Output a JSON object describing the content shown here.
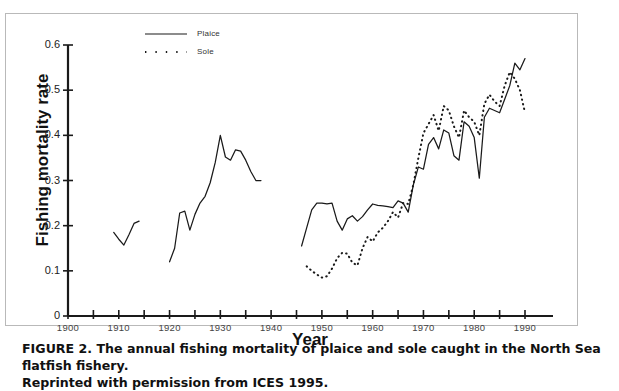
{
  "figure": {
    "caption_line1": "FIGURE 2. The annual fishing mortality of plaice and sole caught in the North Sea flatfish fishery.",
    "caption_line2": "Reprinted with permission from ICES 1995."
  },
  "legend": {
    "entries": [
      {
        "label": "Plaice",
        "style": "solid"
      },
      {
        "label": "Sole",
        "style": "dotted"
      }
    ]
  },
  "axes": {
    "y_title": "Fishing mortality rate",
    "x_title": "Year",
    "y_ticks": [
      "0",
      "0.1",
      "0.2",
      "0.3",
      "0.4",
      "0.5",
      "0.6"
    ],
    "x_ticks": [
      "1900",
      "1910",
      "1920",
      "1930",
      "1940",
      "1950",
      "1960",
      "1970",
      "1980",
      "1990"
    ]
  },
  "chart_data": {
    "type": "line",
    "title": "The annual fishing mortality of plaice and sole caught in the North Sea flatfish fishery",
    "xlabel": "Year",
    "ylabel": "Fishing mortality rate",
    "xlim": [
      1900,
      1990
    ],
    "ylim": [
      0,
      0.6
    ],
    "yticks": [
      0,
      0.1,
      0.2,
      0.3,
      0.4,
      0.5,
      0.6
    ],
    "xticks": [
      1900,
      1910,
      1920,
      1930,
      1940,
      1950,
      1960,
      1970,
      1980,
      1990
    ],
    "x_minor_tick_step": 5,
    "grid": false,
    "legend_position": "top-center",
    "colors": {
      "plaice": "#1a1a1a",
      "sole": "#1a1a1a"
    },
    "series": [
      {
        "name": "Plaice",
        "style": "solid",
        "segments": [
          {
            "x": [
              1909,
              1910,
              1911,
              1912,
              1913,
              1914
            ],
            "y": [
              0.185,
              0.17,
              0.157,
              0.18,
              0.205,
              0.21
            ]
          },
          {
            "x": [
              1920,
              1921,
              1922,
              1923,
              1924,
              1925,
              1926,
              1927,
              1928,
              1929,
              1930,
              1931,
              1932,
              1933,
              1934,
              1935,
              1936,
              1937,
              1938
            ],
            "y": [
              0.12,
              0.15,
              0.228,
              0.232,
              0.19,
              0.225,
              0.25,
              0.265,
              0.295,
              0.34,
              0.4,
              0.352,
              0.345,
              0.368,
              0.365,
              0.345,
              0.32,
              0.3,
              0.3
            ]
          },
          {
            "x": [
              1946,
              1947,
              1948,
              1949,
              1950,
              1951,
              1952,
              1953,
              1954,
              1955,
              1956,
              1957,
              1958,
              1959,
              1960,
              1961,
              1962,
              1963,
              1964,
              1965,
              1966,
              1967,
              1968,
              1969,
              1970,
              1971,
              1972,
              1973,
              1974,
              1975,
              1976,
              1977,
              1978,
              1979,
              1980,
              1981,
              1982,
              1983,
              1984,
              1985,
              1986,
              1987,
              1988,
              1989,
              1990
            ],
            "y": [
              0.155,
              0.195,
              0.235,
              0.25,
              0.25,
              0.248,
              0.25,
              0.21,
              0.19,
              0.215,
              0.222,
              0.21,
              0.22,
              0.235,
              0.248,
              0.245,
              0.244,
              0.242,
              0.24,
              0.255,
              0.25,
              0.23,
              0.29,
              0.33,
              0.325,
              0.38,
              0.395,
              0.37,
              0.412,
              0.405,
              0.355,
              0.345,
              0.43,
              0.42,
              0.395,
              0.305,
              0.44,
              0.46,
              0.455,
              0.45,
              0.48,
              0.51,
              0.56,
              0.545,
              0.57
            ]
          }
        ]
      },
      {
        "name": "Sole",
        "style": "dotted",
        "segments": [
          {
            "x": [
              1947,
              1948,
              1949,
              1950,
              1951,
              1952,
              1953,
              1954,
              1955,
              1956,
              1957,
              1958,
              1959,
              1960,
              1961,
              1962,
              1963,
              1964,
              1965,
              1966,
              1967,
              1968,
              1969,
              1970,
              1971,
              1972,
              1973,
              1974,
              1975,
              1976,
              1977,
              1978,
              1979,
              1980,
              1981,
              1982,
              1983,
              1984,
              1985,
              1986,
              1987,
              1988,
              1989,
              1990
            ],
            "y": [
              0.11,
              0.1,
              0.092,
              0.085,
              0.088,
              0.105,
              0.128,
              0.14,
              0.138,
              0.118,
              0.112,
              0.15,
              0.175,
              0.165,
              0.185,
              0.195,
              0.21,
              0.23,
              0.218,
              0.25,
              0.248,
              0.29,
              0.35,
              0.405,
              0.425,
              0.445,
              0.41,
              0.465,
              0.455,
              0.42,
              0.395,
              0.455,
              0.44,
              0.43,
              0.4,
              0.47,
              0.49,
              0.475,
              0.465,
              0.51,
              0.54,
              0.525,
              0.5,
              0.45
            ]
          }
        ]
      }
    ]
  }
}
